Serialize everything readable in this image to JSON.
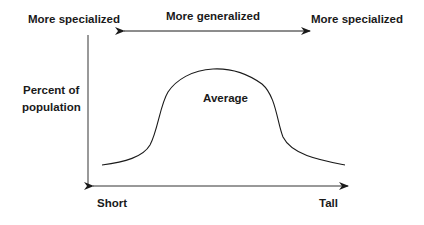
{
  "diagram": {
    "top_axis": {
      "center_label": "More generalized",
      "left_label": "More specialized",
      "right_label": "More specialized"
    },
    "y_axis": {
      "label_line1": "Percent of",
      "label_line2": "population"
    },
    "x_axis": {
      "left_label": "Short",
      "right_label": "Tall"
    },
    "curve": {
      "peak_label": "Average",
      "shape": "bell curve"
    },
    "colors": {
      "line": "#1a1a1a",
      "axis": "#555555",
      "background": "#ffffff"
    }
  }
}
